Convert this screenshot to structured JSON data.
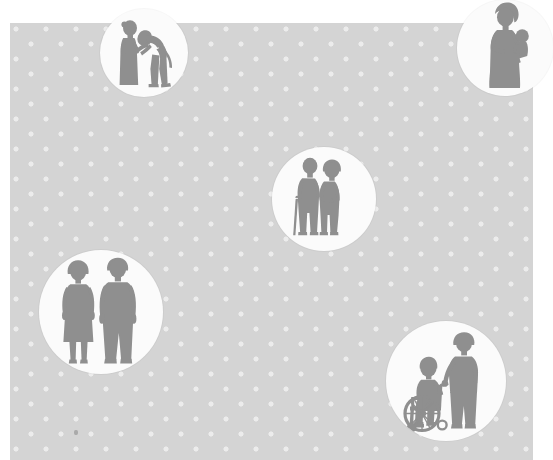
{
  "illustration": {
    "title": "Elderly Care Silhouettes",
    "background": {
      "name": "dotted-panel",
      "color": "#d4d4d4",
      "dot_color": "#ffffff",
      "x": 10,
      "y": 23,
      "width": 523,
      "height": 437
    },
    "page_background_color": "#ffffff",
    "silhouette_color": "#8f8f8f",
    "circle_fill_color": "#fbfbfb",
    "circle_count": 5,
    "circles": [
      {
        "id": "examination",
        "label": "Caregiver examining elderly person",
        "alt": "Silhouette of a standing elderly figure and a caregiver bending forward to examine them",
        "x": 100,
        "y": 9,
        "diameter": 88,
        "figures": [
          "elderly-standing",
          "caregiver-bending"
        ]
      },
      {
        "id": "mother-child",
        "label": "Woman holding a child",
        "alt": "Silhouette of a woman in a long dress holding a small child on her hip",
        "x": 457,
        "y": 0,
        "diameter": 96,
        "figures": [
          "woman-long-dress",
          "child-held"
        ]
      },
      {
        "id": "elderly-couple",
        "label": "Elderly couple with walking cane",
        "alt": "Silhouette of an elderly man leaning on a cane beside an elderly woman in a coat",
        "x": 272,
        "y": 147,
        "diameter": 104,
        "figures": [
          "elderly-man-with-cane",
          "elderly-woman"
        ]
      },
      {
        "id": "standing-couple",
        "label": "Standing woman and man",
        "alt": "Silhouette of a woman in a skirt standing beside a man, both facing forward",
        "x": 39,
        "y": 250,
        "diameter": 124,
        "figures": [
          "woman-standing",
          "man-standing"
        ]
      },
      {
        "id": "wheelchair",
        "label": "Caregiver pushing a wheelchair",
        "alt": "Silhouette of a person seated in a wheelchair being pushed by a standing caregiver",
        "x": 386,
        "y": 321,
        "diameter": 120,
        "figures": [
          "wheelchair-user",
          "caregiver-pushing"
        ]
      }
    ],
    "floor_mark": {
      "name": "floor-speck",
      "x": 74,
      "y": 430
    }
  }
}
